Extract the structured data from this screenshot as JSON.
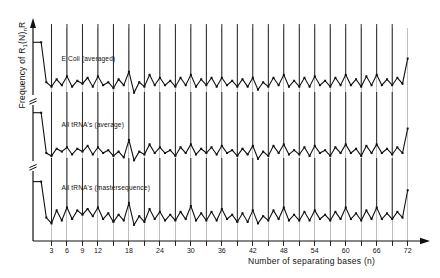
{
  "figure": {
    "ylabel_main": "Frequency of R",
    "ylabel_sub1": "1",
    "ylabel_mid": "(N)",
    "ylabel_sub2": "n",
    "ylabel_end": "R",
    "ylabel_full": "Frequency of R1(N)nR",
    "xlabel": "Number of separating bases (n)",
    "axis_color": "#111111",
    "grid_color": "#8a8a8a",
    "curve_color": "#111111"
  },
  "panels": [
    {
      "id": "e-coli-averaged",
      "label": "E Coli (averaged)"
    },
    {
      "id": "all-trnas-average",
      "label": "All tRNA's (average)"
    },
    {
      "id": "all-trnas-mastersequence",
      "label": "All tRNA's (mastersequence)"
    }
  ],
  "chart_data": {
    "type": "line",
    "title": "",
    "xlabel": "Number of separating bases (n)",
    "ylabel": "Frequency of R1(N)nR",
    "xlim": [
      0,
      74
    ],
    "grid": true,
    "grid_x_every": 3,
    "legend": "none",
    "tick_labels": [
      3,
      6,
      9,
      12,
      18,
      24,
      30,
      36,
      42,
      48,
      54,
      60,
      66,
      72
    ],
    "minor_ticks": [
      15,
      21,
      27,
      33,
      39,
      45,
      51,
      57,
      63,
      69
    ],
    "x": [
      1,
      2,
      3,
      4,
      5,
      6,
      7,
      8,
      9,
      10,
      11,
      12,
      13,
      14,
      15,
      16,
      17,
      18,
      19,
      20,
      21,
      22,
      23,
      24,
      25,
      26,
      27,
      28,
      29,
      30,
      31,
      32,
      33,
      34,
      35,
      36,
      37,
      38,
      39,
      40,
      41,
      42,
      43,
      44,
      45,
      46,
      47,
      48,
      49,
      50,
      51,
      52,
      53,
      54,
      55,
      56,
      57,
      58,
      59,
      60,
      61,
      62,
      63,
      64,
      65,
      66,
      67,
      68,
      69,
      70,
      71,
      72
    ],
    "series": [
      {
        "name": "E Coli (averaged)",
        "panel": "e-coli-averaged",
        "ylim": [
          0,
          100
        ],
        "values": [
          78,
          24,
          18,
          28,
          20,
          32,
          18,
          26,
          22,
          30,
          18,
          32,
          20,
          24,
          16,
          28,
          20,
          38,
          10,
          24,
          18,
          34,
          20,
          30,
          20,
          26,
          18,
          30,
          20,
          34,
          18,
          28,
          20,
          30,
          18,
          30,
          20,
          26,
          18,
          28,
          18,
          30,
          14,
          24,
          18,
          30,
          20,
          34,
          18,
          26,
          18,
          30,
          18,
          32,
          20,
          26,
          18,
          30,
          20,
          34,
          20,
          28,
          18,
          32,
          20,
          34,
          20,
          28,
          20,
          30,
          22,
          56
        ]
      },
      {
        "name": "All tRNA's (average)",
        "panel": "all-trnas-average",
        "ylim": [
          0,
          100
        ],
        "values": [
          74,
          18,
          14,
          24,
          20,
          26,
          16,
          24,
          20,
          28,
          16,
          26,
          18,
          22,
          14,
          20,
          12,
          36,
          8,
          20,
          16,
          30,
          18,
          26,
          18,
          22,
          14,
          26,
          18,
          30,
          16,
          24,
          18,
          26,
          16,
          28,
          18,
          22,
          14,
          24,
          16,
          28,
          10,
          20,
          14,
          28,
          18,
          30,
          16,
          22,
          16,
          26,
          14,
          28,
          18,
          22,
          14,
          26,
          18,
          30,
          18,
          24,
          14,
          28,
          18,
          30,
          18,
          24,
          16,
          26,
          18,
          52
        ]
      },
      {
        "name": "All tRNA's (mastersequence)",
        "panel": "all-trnas-mastersequence",
        "ylim": [
          0,
          100
        ],
        "values": [
          70,
          20,
          12,
          30,
          16,
          34,
          18,
          30,
          24,
          32,
          22,
          34,
          18,
          26,
          14,
          24,
          16,
          40,
          10,
          22,
          14,
          32,
          18,
          28,
          16,
          24,
          16,
          28,
          18,
          36,
          16,
          26,
          16,
          28,
          16,
          32,
          18,
          24,
          14,
          26,
          14,
          30,
          12,
          22,
          16,
          30,
          18,
          34,
          16,
          24,
          16,
          28,
          16,
          30,
          18,
          24,
          16,
          28,
          18,
          34,
          18,
          26,
          16,
          30,
          18,
          34,
          18,
          26,
          18,
          28,
          20,
          58
        ]
      }
    ],
    "spike_positions": [
      3,
      6,
      9,
      12,
      15,
      18,
      21,
      24,
      27,
      30,
      33,
      36,
      39,
      42,
      45,
      48,
      51,
      54,
      57,
      60,
      63,
      66,
      69,
      72
    ]
  }
}
